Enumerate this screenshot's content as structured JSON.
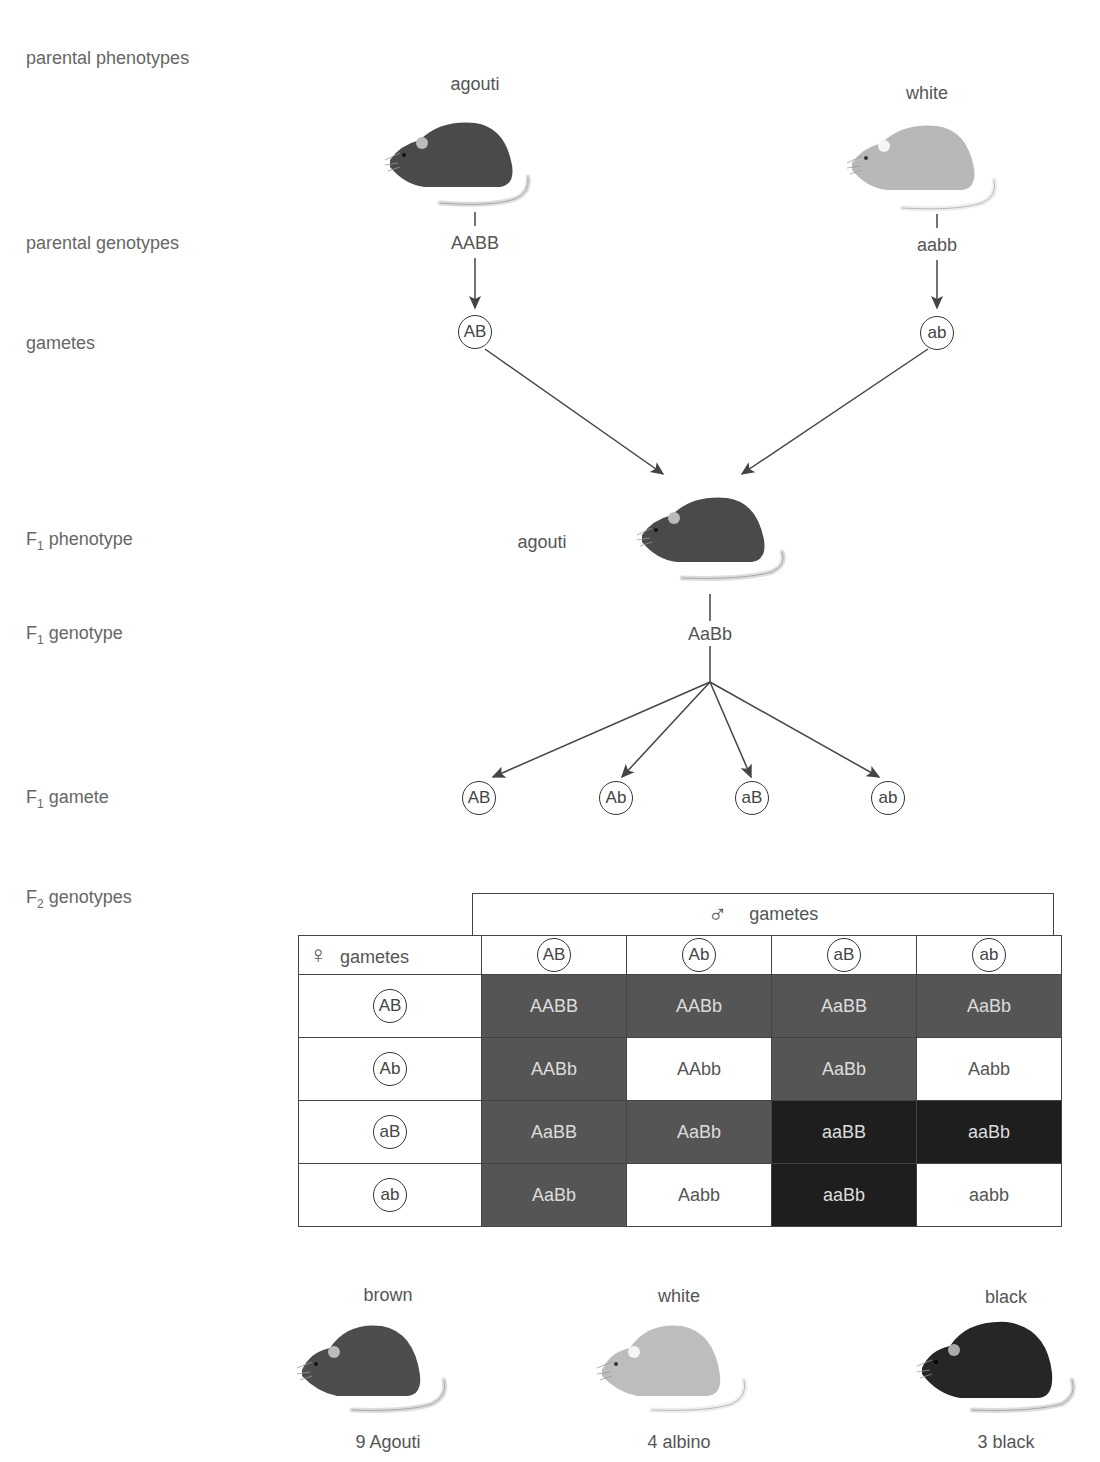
{
  "row_labels": {
    "parental_phenotypes": "parental phenotypes",
    "parental_genotypes": "parental genotypes",
    "gametes": "gametes",
    "f1_phenotype": {
      "prefix": "F",
      "sub": "1",
      "text": " phenotype"
    },
    "f1_genotype": {
      "prefix": "F",
      "sub": "1",
      "text": " genotype"
    },
    "f1_gamete": {
      "prefix": "F",
      "sub": "1",
      "text": " gamete"
    },
    "f2_genotypes": {
      "prefix": "F",
      "sub": "2",
      "text": " genotypes"
    }
  },
  "parents": {
    "left": {
      "phenotype": "agouti",
      "genotype": "AABB",
      "gamete": "AB",
      "color": "#4a4a4a"
    },
    "right": {
      "phenotype": "white",
      "genotype": "aabb",
      "gamete": "ab",
      "color": "#b8b8b8"
    }
  },
  "f1": {
    "phenotype": "agouti",
    "genotype": "AaBb",
    "gametes": [
      "AB",
      "Ab",
      "aB",
      "ab"
    ]
  },
  "punnett": {
    "male_header": "gametes",
    "female_header": "gametes",
    "male_symbol": "♂",
    "female_symbol": "♀",
    "columns": [
      "AB",
      "Ab",
      "aB",
      "ab"
    ],
    "rows": [
      {
        "gamete": "AB",
        "cells": [
          {
            "g": "AABB",
            "t": "agouti"
          },
          {
            "g": "AABb",
            "t": "agouti"
          },
          {
            "g": "AaBB",
            "t": "agouti"
          },
          {
            "g": "AaBb",
            "t": "agouti"
          }
        ]
      },
      {
        "gamete": "Ab",
        "cells": [
          {
            "g": "AABb",
            "t": "agouti"
          },
          {
            "g": "AAbb",
            "t": "white"
          },
          {
            "g": "AaBb",
            "t": "agouti"
          },
          {
            "g": "Aabb",
            "t": "white"
          }
        ]
      },
      {
        "gamete": "aB",
        "cells": [
          {
            "g": "AaBB",
            "t": "agouti"
          },
          {
            "g": "AaBb",
            "t": "agouti"
          },
          {
            "g": "aaBB",
            "t": "black"
          },
          {
            "g": "aaBb",
            "t": "black"
          }
        ]
      },
      {
        "gamete": "ab",
        "cells": [
          {
            "g": "AaBb",
            "t": "agouti"
          },
          {
            "g": "Aabb",
            "t": "white"
          },
          {
            "g": "aaBb",
            "t": "black"
          },
          {
            "g": "aabb",
            "t": "white"
          }
        ]
      }
    ],
    "colors": {
      "agouti": "#555555",
      "white": "#ffffff",
      "black": "#1e1e1e"
    }
  },
  "f2_phenotypes": [
    {
      "label": "brown",
      "count": "9 Agouti",
      "color": "#4d4d4d"
    },
    {
      "label": "white",
      "count": "4 albino",
      "color": "#bdbdbd"
    },
    {
      "label": "black",
      "count": "3 black",
      "color": "#262626"
    }
  ]
}
